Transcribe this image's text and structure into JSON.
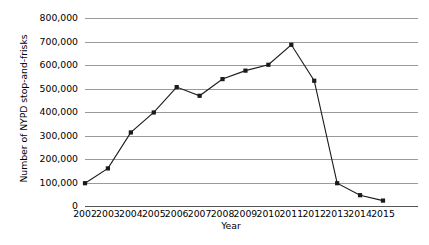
{
  "chart_data": {
    "type": "line",
    "title": "",
    "xlabel": "Year",
    "ylabel": "Number of NYPD stop-and-frisks",
    "categories": [
      "2002",
      "2003",
      "2004",
      "2005",
      "2006",
      "2007",
      "2008",
      "2009",
      "2010",
      "2011",
      "2012",
      "2013",
      "2014",
      "2015"
    ],
    "values": [
      97000,
      160000,
      313000,
      398000,
      506000,
      469000,
      540000,
      576000,
      601000,
      686000,
      533000,
      97000,
      46000,
      23000
    ],
    "series": [
      {
        "name": "NYPD stop-and-frisks",
        "values": [
          97000,
          160000,
          313000,
          398000,
          506000,
          469000,
          540000,
          576000,
          601000,
          686000,
          533000,
          97000,
          46000,
          23000
        ]
      }
    ],
    "ylim": [
      0,
      800000
    ],
    "yticks": [
      0,
      100000,
      200000,
      300000,
      400000,
      500000,
      600000,
      700000,
      800000
    ],
    "ytick_labels": [
      "0",
      "100,000",
      "200,000",
      "300,000",
      "400,000",
      "500,000",
      "600,000",
      "700,000",
      "800,000"
    ],
    "grid": true,
    "legend": "none",
    "line_color": "#1a1a1a",
    "marker_color": "#1a1a1a",
    "gridline_color": "#9a9a9a",
    "axis_color": "#555555",
    "background_color": "#ffffff",
    "marker": "square"
  }
}
